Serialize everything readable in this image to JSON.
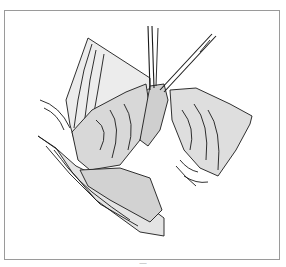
{
  "figure": {
    "caption": "—",
    "colors": {
      "line": "#1a1a1a",
      "frame": "#9a9a9a",
      "background": "#ffffff"
    }
  }
}
